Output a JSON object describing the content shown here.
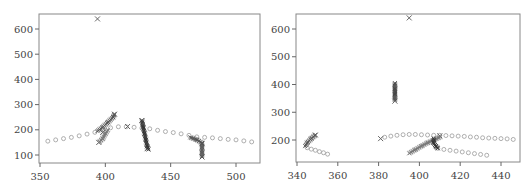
{
  "chart_data": [
    {
      "type": "scatter",
      "title": "",
      "xlabel": "",
      "ylabel": "",
      "xlim": [
        348,
        518
      ],
      "ylim": [
        70,
        660
      ],
      "xticks": [
        350,
        400,
        450,
        500
      ],
      "yticks": [
        100,
        200,
        300,
        400,
        500,
        600
      ],
      "grid": false,
      "legend": null,
      "series": [
        {
          "name": "ground-truth-track-circles",
          "marker": "o",
          "color": "#9a9a9a",
          "points": [
            [
              356,
              155
            ],
            [
              362,
              160
            ],
            [
              368,
              165
            ],
            [
              374,
              170
            ],
            [
              380,
              176
            ],
            [
              386,
              183
            ],
            [
              392,
              190
            ],
            [
              398,
              200
            ],
            [
              404,
              208
            ],
            [
              410,
              212
            ],
            [
              416,
              212
            ],
            [
              422,
              210
            ],
            [
              428,
              207
            ],
            [
              434,
              204
            ],
            [
              440,
              198
            ],
            [
              446,
              193
            ],
            [
              452,
              189
            ],
            [
              458,
              184
            ],
            [
              464,
              178
            ],
            [
              470,
              172
            ],
            [
              476,
              170
            ],
            [
              482,
              168
            ],
            [
              488,
              165
            ],
            [
              494,
              162
            ],
            [
              500,
              160
            ],
            [
              506,
              156
            ],
            [
              512,
              152
            ]
          ]
        },
        {
          "name": "estimated-track-crosses",
          "marker": "x",
          "color": "#666666",
          "points": [
            [
              394,
              640
            ],
            [
              407,
              262
            ],
            [
              417,
              213
            ],
            [
              428,
              237
            ],
            [
              432,
              125
            ],
            [
              474,
              145
            ],
            [
              474,
              92
            ],
            [
              395,
              150
            ],
            [
              398,
              190
            ]
          ]
        },
        {
          "name": "dense-segment-a",
          "marker": "x",
          "color": "#555555",
          "points": [
            [
              394,
              195
            ],
            [
              398,
              210
            ],
            [
              402,
              230
            ],
            [
              406,
              250
            ],
            [
              407,
              262
            ]
          ]
        },
        {
          "name": "dense-segment-b",
          "marker": "x",
          "color": "#777777",
          "points": [
            [
              395,
              150
            ],
            [
              398,
              165
            ],
            [
              400,
              185
            ],
            [
              402,
              200
            ]
          ]
        },
        {
          "name": "dense-segment-c",
          "marker": "x",
          "color": "#333333",
          "points": [
            [
              428,
              237
            ],
            [
              429,
              210
            ],
            [
              430,
              185
            ],
            [
              431,
              160
            ],
            [
              432,
              135
            ],
            [
              433,
              122
            ]
          ]
        },
        {
          "name": "dense-segment-d",
          "marker": "x",
          "color": "#555555",
          "points": [
            [
              465,
              170
            ],
            [
              470,
              160
            ],
            [
              474,
              148
            ],
            [
              474,
              130
            ],
            [
              474,
              110
            ],
            [
              474,
              92
            ]
          ]
        }
      ]
    },
    {
      "type": "scatter",
      "title": "",
      "xlabel": "",
      "ylabel": "",
      "xlim": [
        339,
        450
      ],
      "ylim": [
        115,
        660
      ],
      "xticks": [
        340,
        360,
        380,
        400,
        420,
        440
      ],
      "yticks": [
        200,
        300,
        400,
        500,
        600
      ],
      "grid": false,
      "legend": null,
      "series": [
        {
          "name": "ground-truth-track-circles",
          "marker": "o",
          "color": "#9a9a9a",
          "points": [
            [
              345,
              172
            ],
            [
              347,
              167
            ],
            [
              349,
              163
            ],
            [
              351,
              158
            ],
            [
              353,
              154
            ],
            [
              355,
              149
            ],
            [
              383,
              210
            ],
            [
              386,
              214
            ],
            [
              389,
              217
            ],
            [
              392,
              219
            ],
            [
              395,
              220
            ],
            [
              398,
              220
            ],
            [
              401,
              219
            ],
            [
              404,
              218
            ],
            [
              407,
              217
            ],
            [
              410,
              217
            ],
            [
              413,
              216
            ],
            [
              416,
              215
            ],
            [
              419,
              214
            ],
            [
              422,
              213
            ],
            [
              425,
              211
            ],
            [
              428,
              210
            ],
            [
              431,
              208
            ],
            [
              434,
              207
            ],
            [
              437,
              206
            ],
            [
              440,
              205
            ],
            [
              443,
              204
            ],
            [
              446,
              202
            ],
            [
              409,
              170
            ],
            [
              412,
              166
            ],
            [
              415,
              163
            ],
            [
              418,
              160
            ],
            [
              421,
              157
            ],
            [
              424,
              154
            ],
            [
              427,
              151
            ],
            [
              430,
              148
            ],
            [
              433,
              145
            ]
          ]
        },
        {
          "name": "estimated-track-crosses",
          "marker": "x",
          "color": "#666666",
          "points": [
            [
              395,
              640
            ],
            [
              349,
              218
            ],
            [
              381,
              205
            ],
            [
              388,
              340
            ],
            [
              410,
              215
            ]
          ]
        },
        {
          "name": "dense-segment-a",
          "marker": "x",
          "color": "#555555",
          "points": [
            [
              344,
              178
            ],
            [
              345,
              190
            ],
            [
              347,
              205
            ],
            [
              349,
              218
            ]
          ]
        },
        {
          "name": "dense-segment-b",
          "marker": "x",
          "color": "#444444",
          "points": [
            [
              388,
              405
            ],
            [
              388,
              385
            ],
            [
              388,
              365
            ],
            [
              388,
              345
            ]
          ]
        },
        {
          "name": "dense-segment-c",
          "marker": "x",
          "color": "#777777",
          "points": [
            [
              395,
              152
            ],
            [
              398,
              165
            ],
            [
              401,
              178
            ],
            [
              404,
              190
            ],
            [
              407,
              200
            ],
            [
              410,
              210
            ]
          ]
        },
        {
          "name": "dense-segment-d",
          "marker": "x",
          "color": "#333333",
          "points": [
            [
              407,
              205
            ],
            [
              407,
              190
            ],
            [
              408,
              178
            ],
            [
              409,
              170
            ]
          ]
        }
      ]
    }
  ]
}
